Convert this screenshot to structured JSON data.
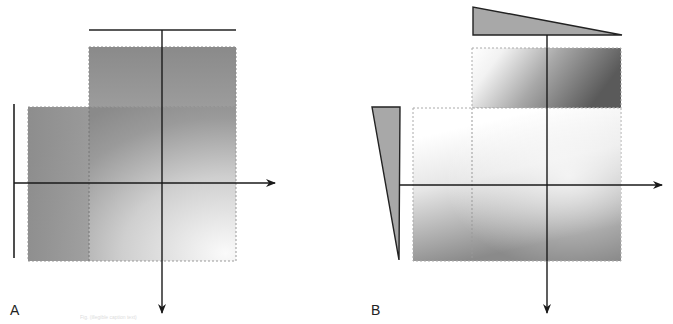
{
  "figure": {
    "panels": [
      {
        "label": "A",
        "description": "Uniform-field dose distribution without wedges",
        "top_bar": {
          "x1": 89,
          "x2": 236,
          "y": 30
        },
        "left_bar": {
          "x": 14,
          "y1": 104,
          "y2": 258
        },
        "vertical_axis": {
          "x": 162,
          "y1": 30,
          "y2": 313
        },
        "horizontal_axis": {
          "y": 183,
          "x1": 14,
          "x2": 275
        },
        "top_field": {
          "x": 89,
          "y": 47,
          "w": 147,
          "h": 60
        },
        "lower_field": {
          "x": 28,
          "y": 107,
          "w": 208,
          "h": 154,
          "divider_x": 89
        },
        "colors": {
          "dark": "#6e6e6e",
          "mid": "#9a9a9a",
          "light": "#f4f4f4"
        }
      },
      {
        "label": "B",
        "description": "Wedged-field dose distribution",
        "top_wedge": {
          "points": "473,7 473,35 622,35"
        },
        "left_wedge": {
          "points": "372,107 400,107 399,260"
        },
        "vertical_axis": {
          "x": 547,
          "y1": 35,
          "y2": 313
        },
        "horizontal_axis": {
          "y": 185,
          "x1": 399,
          "x2": 662
        },
        "top_field": {
          "x": 472,
          "y": 48,
          "w": 149,
          "h": 60
        },
        "lower_field": {
          "x": 413,
          "y": 108,
          "w": 208,
          "h": 153,
          "divider_x": 472
        },
        "colors": {
          "dark": "#5a5a5a",
          "mid": "#b8b8b8",
          "light": "#ffffff",
          "wedge_fill": "#a8a8a8"
        }
      }
    ],
    "caption": "Fig. (illegible caption text)"
  }
}
